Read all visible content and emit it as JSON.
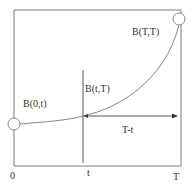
{
  "diagram": {
    "type": "yield-curve-schematic",
    "colors": {
      "line": "#555555",
      "frame": "#7a7a7a",
      "text": "#333333",
      "background": "#ffffff"
    },
    "labels": {
      "point_start": "B(0,t)",
      "point_mid": "B(t,T)",
      "point_end": "B(T,T)",
      "interval": "T-t"
    },
    "axis": {
      "ticks": [
        "0",
        "t",
        "T"
      ]
    }
  }
}
